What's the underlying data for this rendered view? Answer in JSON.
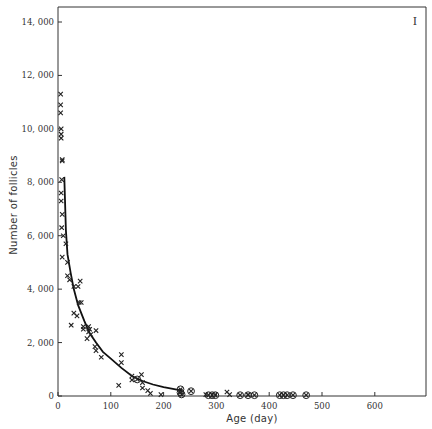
{
  "chart_data": {
    "type": "scatter",
    "title": "",
    "panel_label": "I",
    "xlabel": "Age (day)",
    "ylabel": "Number of follicles",
    "xlim": [
      0,
      690
    ],
    "ylim": [
      0,
      14500
    ],
    "x_ticks": [
      0,
      100,
      200,
      300,
      400,
      500,
      600
    ],
    "x_tick_labels": [
      "0",
      "100",
      "200",
      "300",
      "400",
      "500",
      "600"
    ],
    "y_ticks": [
      0,
      2000,
      4000,
      6000,
      8000,
      10000,
      12000,
      14000
    ],
    "y_tick_labels": [
      "0",
      "2, 000",
      "4, 000",
      "6, 000",
      "8, 000",
      "10, 000",
      "12, 000",
      "14, 000"
    ],
    "grid": false,
    "legend": null,
    "series": [
      {
        "name": "Follicle counts (x)",
        "marker": "x",
        "points": [
          [
            5,
            11300
          ],
          [
            5,
            10900
          ],
          [
            5,
            10600
          ],
          [
            6,
            10000
          ],
          [
            6,
            9800
          ],
          [
            6,
            9650
          ],
          [
            8,
            8850
          ],
          [
            8,
            8800
          ],
          [
            7,
            8100
          ],
          [
            6,
            7600
          ],
          [
            6,
            7300
          ],
          [
            8,
            6800
          ],
          [
            7,
            6300
          ],
          [
            10,
            6000
          ],
          [
            8,
            5200
          ],
          [
            15,
            5700
          ],
          [
            18,
            5000
          ],
          [
            18,
            4500
          ],
          [
            22,
            4350
          ],
          [
            30,
            4100
          ],
          [
            38,
            4100
          ],
          [
            42,
            4300
          ],
          [
            40,
            3500
          ],
          [
            44,
            3500
          ],
          [
            25,
            2650
          ],
          [
            30,
            3100
          ],
          [
            36,
            3000
          ],
          [
            48,
            2500
          ],
          [
            48,
            2600
          ],
          [
            58,
            2600
          ],
          [
            60,
            2500
          ],
          [
            58,
            2400
          ],
          [
            62,
            2300
          ],
          [
            55,
            2150
          ],
          [
            72,
            2450
          ],
          [
            70,
            1850
          ],
          [
            72,
            1700
          ],
          [
            82,
            1450
          ],
          [
            120,
            1550
          ],
          [
            120,
            1250
          ],
          [
            115,
            400
          ],
          [
            140,
            750
          ],
          [
            140,
            600
          ],
          [
            158,
            800
          ],
          [
            160,
            500
          ],
          [
            160,
            300
          ],
          [
            170,
            200
          ],
          [
            175,
            100
          ],
          [
            195,
            50
          ],
          [
            280,
            50
          ],
          [
            325,
            50
          ],
          [
            320,
            150
          ],
          [
            360,
            50
          ]
        ]
      },
      {
        "name": "Follicle counts (circled)",
        "marker": "circled-x",
        "points": [
          [
            150,
            620
          ],
          [
            232,
            250
          ],
          [
            232,
            130
          ],
          [
            234,
            60
          ],
          [
            252,
            180
          ],
          [
            285,
            30
          ],
          [
            292,
            30
          ],
          [
            298,
            30
          ],
          [
            345,
            30
          ],
          [
            360,
            30
          ],
          [
            372,
            30
          ],
          [
            420,
            30
          ],
          [
            427,
            30
          ],
          [
            434,
            30
          ],
          [
            445,
            30
          ],
          [
            470,
            30
          ]
        ]
      },
      {
        "name": "Fitted curve",
        "marker": "line",
        "points": [
          [
            12,
            8200
          ],
          [
            15,
            6200
          ],
          [
            18,
            5300
          ],
          [
            24,
            4600
          ],
          [
            30,
            4000
          ],
          [
            38,
            3400
          ],
          [
            50,
            2800
          ],
          [
            60,
            2350
          ],
          [
            72,
            2000
          ],
          [
            85,
            1650
          ],
          [
            100,
            1400
          ],
          [
            120,
            1050
          ],
          [
            140,
            750
          ],
          [
            160,
            560
          ],
          [
            180,
            430
          ],
          [
            200,
            330
          ],
          [
            220,
            260
          ],
          [
            235,
            200
          ]
        ]
      }
    ]
  }
}
